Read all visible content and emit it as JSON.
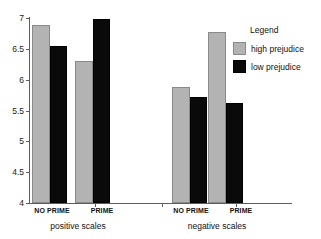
{
  "chart_data": {
    "type": "bar",
    "title": "",
    "xlabel": "",
    "ylabel": "",
    "ylim": [
      4,
      7
    ],
    "ytick_labels": [
      "7",
      "6.5",
      "6",
      "5.5",
      "5",
      "4.5",
      "4"
    ],
    "ytick_values": [
      7,
      6.5,
      6,
      5.5,
      5,
      4.5,
      4
    ],
    "grid": false,
    "legend": {
      "title": "Legend",
      "position": "right",
      "entries": [
        {
          "name": "high prejudice",
          "color": "#b3b3b3"
        },
        {
          "name": "low prejudice",
          "color": "#0a0a0a"
        }
      ]
    },
    "groups": [
      {
        "name": "positive scales",
        "categories": [
          "NO PRIME",
          "PRIME"
        ],
        "series": [
          {
            "name": "high prejudice",
            "values": [
              6.89,
              6.31
            ]
          },
          {
            "name": "low prejudice",
            "values": [
              6.55,
              6.99
            ]
          }
        ]
      },
      {
        "name": "negative scales",
        "categories": [
          "NO PRIME",
          "PRIME"
        ],
        "series": [
          {
            "name": "high prejudice",
            "values": [
              5.88,
              6.78
            ]
          },
          {
            "name": "low prejudice",
            "values": [
              5.72,
              5.62
            ]
          }
        ]
      }
    ]
  },
  "axis": {
    "ticks": [
      "7",
      "6.5",
      "6",
      "5.5",
      "5",
      "4.5",
      "4"
    ]
  },
  "legend": {
    "title": "Legend",
    "high_label": "high prejudice",
    "low_label": "low prejudice",
    "high_color": "#b3b3b3",
    "low_color": "#0a0a0a"
  },
  "groups": {
    "positive": {
      "label": "positive scales",
      "cat1": "NO PRIME",
      "cat2": "PRIME"
    },
    "negative": {
      "label": "negative scales",
      "cat1": "NO PRIME",
      "cat2": "PRIME"
    }
  }
}
